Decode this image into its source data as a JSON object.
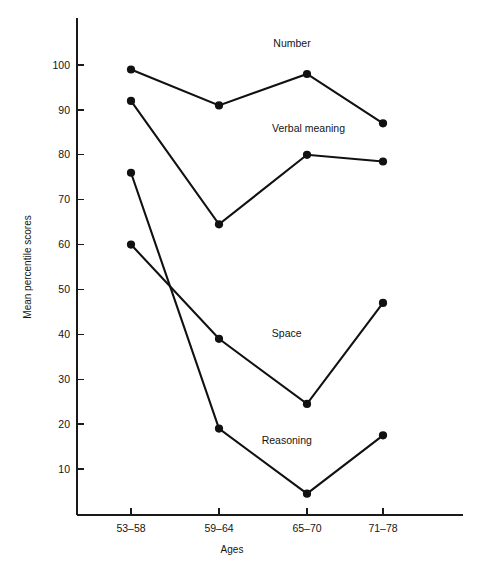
{
  "chart_data": {
    "type": "line",
    "title": "",
    "xlabel": "Ages",
    "ylabel": "Mean percentile scores",
    "categories": [
      "53–58",
      "59–64",
      "65–70",
      "71–78"
    ],
    "ylim": [
      0,
      105
    ],
    "yticks": [
      10,
      20,
      30,
      40,
      50,
      60,
      70,
      80,
      90,
      100
    ],
    "ytick_labels": [
      "10",
      "20",
      "30",
      "40",
      "50",
      "60",
      "70",
      "80",
      "90",
      "100"
    ],
    "grid": false,
    "legend_position": "inline-labels",
    "series": [
      {
        "name": "Number",
        "values": [
          99,
          91,
          98,
          87
        ],
        "color": "#111111",
        "label_x_category_fraction": 1.83,
        "label_y_value": 104
      },
      {
        "name": "Verbal meaning",
        "values": [
          92,
          64.5,
          80,
          78.5
        ],
        "color": "#111111",
        "label_x_category_fraction": 2.02,
        "label_y_value": 85
      },
      {
        "name": "Space",
        "values": [
          60,
          39,
          24.5,
          47
        ],
        "color": "#111111",
        "label_x_category_fraction": 1.77,
        "label_y_value": 39.5
      },
      {
        "name": "Reasoning",
        "values": [
          76,
          19,
          4.5,
          17.5
        ],
        "color": "#111111",
        "label_x_category_fraction": 1.77,
        "label_y_value": 15.5
      }
    ]
  },
  "figure": {
    "caption": "",
    "background_color": "#ffffff",
    "axis_color": "#1a1a1a"
  }
}
